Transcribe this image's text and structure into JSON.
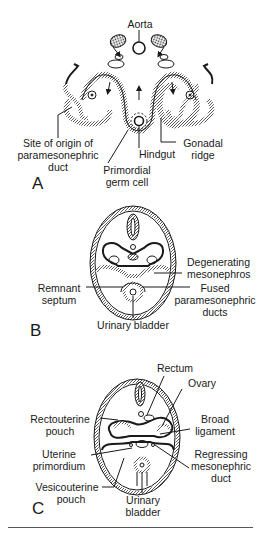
{
  "figure": {
    "panels": [
      {
        "id": "A",
        "letter": "A",
        "labels": {
          "aorta": "Aorta",
          "site_origin_1": "Site of origin of",
          "site_origin_2": "paramesonephric",
          "site_origin_3": "duct",
          "hindgut": "Hindgut",
          "gonadal_1": "Gonadal",
          "gonadal_2": "ridge",
          "primordial_1": "Primordial",
          "primordial_2": "germ cell"
        }
      },
      {
        "id": "B",
        "letter": "B",
        "labels": {
          "degenerating_1": "Degenerating",
          "degenerating_2": "mesonephros",
          "remnant_1": "Remnant",
          "remnant_2": "septum",
          "fused_1": "Fused",
          "fused_2": "paramesonephric",
          "fused_3": "ducts",
          "urinary_bladder": "Urinary bladder"
        }
      },
      {
        "id": "C",
        "letter": "C",
        "labels": {
          "rectum": "Rectum",
          "ovary": "Ovary",
          "rectouterine_1": "Rectouterine",
          "rectouterine_2": "pouch",
          "broad_1": "Broad",
          "broad_2": "ligament",
          "uterine_1": "Uterine",
          "uterine_2": "primordium",
          "regressing_1": "Regressing",
          "regressing_2": "mesonephric",
          "regressing_3": "duct",
          "vesicouterine_1": "Vesicouterine",
          "vesicouterine_2": "pouch",
          "urinary_1": "Urinary",
          "urinary_2": "bladder"
        }
      }
    ],
    "colors": {
      "ink": "#1a1a1a",
      "hatch": "#6a6a6a",
      "background": "#ffffff"
    }
  }
}
